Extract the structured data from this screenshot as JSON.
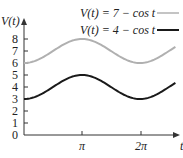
{
  "chart_data": {
    "type": "line",
    "title": "",
    "xlabel": "t",
    "ylabel": "V(t)",
    "xlim": [
      0,
      8.2
    ],
    "ylim": [
      0,
      8
    ],
    "x_ticks": [
      {
        "value": 3.14159,
        "label": "π"
      },
      {
        "value": 6.28318,
        "label": "2π"
      }
    ],
    "y_ticks": [
      0,
      1,
      2,
      3,
      4,
      5,
      6,
      7,
      8
    ],
    "grid": false,
    "legend_position": "top-right",
    "series": [
      {
        "name": "V(t) = 7 − cos t",
        "formula": "7 - cos(t)",
        "color": "#b0b0b0",
        "x": [
          0,
          1.571,
          3.142,
          4.712,
          6.283,
          8.2
        ],
        "values": [
          6,
          7,
          8,
          7,
          6,
          7.34
        ]
      },
      {
        "name": "V(t) = 4 − cos t",
        "formula": "4 - cos(t)",
        "color": "#1a1a1a",
        "x": [
          0,
          1.571,
          3.142,
          4.712,
          6.283,
          8.2
        ],
        "values": [
          3,
          4,
          5,
          4,
          3,
          4.34
        ]
      }
    ]
  },
  "labels": {
    "y_axis": "V(t)",
    "x_axis": "t",
    "legend_1": "V(t) = 7 − cos t",
    "legend_2": "V(t) = 4 − cos t",
    "tick_pi": "π",
    "tick_2pi": "2π",
    "y0": "0",
    "y1": "1",
    "y2": "2",
    "y3": "3",
    "y4": "4",
    "y5": "5",
    "y6": "6",
    "y7": "7",
    "y8": "8"
  }
}
